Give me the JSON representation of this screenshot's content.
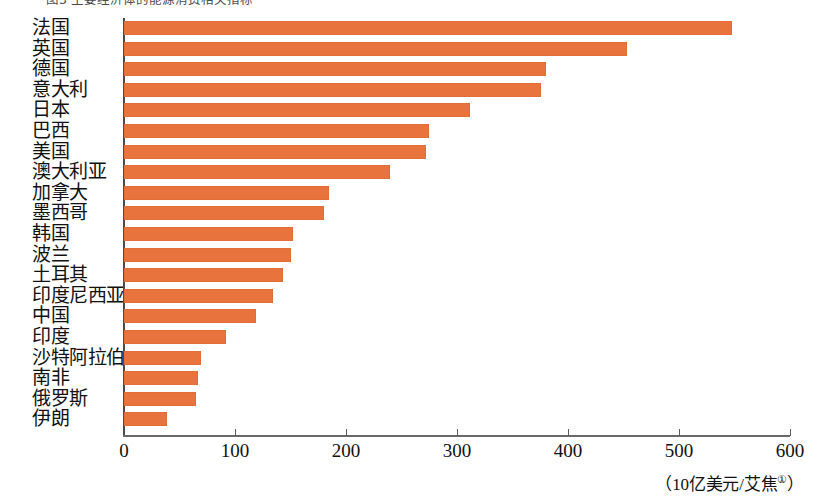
{
  "top_caption": "图3 主要经济体的能源消费相关指标",
  "chart_data": {
    "type": "bar",
    "orientation": "horizontal",
    "title": "",
    "subtitle": "",
    "xlabel": "（10亿美元/艾焦 ①）",
    "ylabel": "",
    "xlim": [
      0,
      600
    ],
    "xticks": [
      0,
      100,
      200,
      300,
      400,
      500,
      600
    ],
    "xtick_labels": [
      "0",
      "100",
      "200",
      "300",
      "400",
      "500",
      "600"
    ],
    "grid": false,
    "legend": null,
    "bar_color": "#e8733c",
    "axis_color": "#4b4b4b",
    "categories": [
      "法国",
      "英国",
      "德国",
      "意大利",
      "日本",
      "巴西",
      "美国",
      "澳大利亚",
      "加拿大",
      "墨西哥",
      "韩国",
      "波兰",
      "土耳其",
      "印度尼西亚",
      "中国",
      "印度",
      "沙特阿拉伯",
      "南非",
      "俄罗斯",
      "伊朗"
    ],
    "values": [
      548,
      453,
      380,
      376,
      312,
      275,
      272,
      240,
      185,
      180,
      152,
      150,
      143,
      134,
      119,
      92,
      69,
      67,
      65,
      39
    ]
  },
  "unit_label": {
    "open_paren": "（",
    "text": "10亿美元/艾焦",
    "footnote_marker": "①",
    "close_paren": "）"
  }
}
